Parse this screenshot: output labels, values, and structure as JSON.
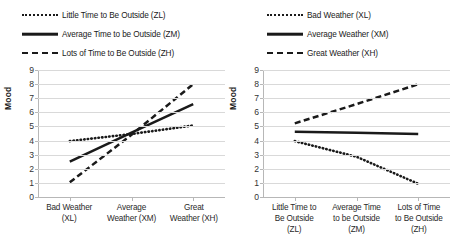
{
  "chart_data": [
    {
      "panel": "left",
      "type": "line",
      "title": "",
      "xlabel": "",
      "ylabel": "Mood",
      "ylim": [
        0,
        9
      ],
      "yticks": [
        0,
        1,
        2,
        3,
        4,
        5,
        6,
        7,
        8,
        9
      ],
      "grid": true,
      "legend_position": "top",
      "categories": [
        "Bad Weather (XL)",
        "Average Weather (XM)",
        "Great Weather (XH)"
      ],
      "category_lines": [
        [
          "Bad Weather",
          "(XL)"
        ],
        [
          "Average",
          "Weather (XM)"
        ],
        [
          "Great",
          "Weather (XH)"
        ]
      ],
      "series": [
        {
          "name": "Little Time to Be Outside (ZL)",
          "style": "dotted",
          "values": [
            4.0,
            4.5,
            5.1
          ]
        },
        {
          "name": "Average Time to be Outside (ZM)",
          "style": "solid",
          "values": [
            2.55,
            4.6,
            6.6
          ]
        },
        {
          "name": "Lots of Time to Be Outside (ZH)",
          "style": "dashed",
          "values": [
            1.1,
            4.45,
            8.0
          ]
        }
      ]
    },
    {
      "panel": "right",
      "type": "line",
      "title": "",
      "xlabel": "",
      "ylabel": "Mood",
      "ylim": [
        0,
        9
      ],
      "yticks": [
        0,
        1,
        2,
        3,
        4,
        5,
        6,
        7,
        8,
        9
      ],
      "grid": true,
      "legend_position": "top",
      "categories": [
        "Little Time to Be Outside (ZL)",
        "Average Time to be Outside (ZM)",
        "Lots of Time to Be Outside (ZH)"
      ],
      "category_lines": [
        [
          "Little Time to",
          "Be Outside",
          "(ZL)"
        ],
        [
          "Average Time",
          "to be Outside",
          "(ZM)"
        ],
        [
          "Lots of Time",
          "to Be Outside",
          "(ZH)"
        ]
      ],
      "series": [
        {
          "name": "Bad Weather (XL)",
          "style": "dotted",
          "values": [
            4.0,
            2.9,
            1.0
          ]
        },
        {
          "name": "Average Weather (XM)",
          "style": "solid",
          "values": [
            4.65,
            4.58,
            4.5
          ]
        },
        {
          "name": "Great Weather (XH)",
          "style": "dashed",
          "values": [
            5.25,
            6.6,
            8.0
          ]
        }
      ]
    }
  ],
  "left_chart": {
    "legend": [
      {
        "label": "Little Time to Be Outside (ZL)",
        "style": "dotted"
      },
      {
        "label": "Average Time to be Outside (ZM)",
        "style": "solid"
      },
      {
        "label": "Lots of Time to Be Outside (ZH)",
        "style": "dashed"
      }
    ],
    "ylabel": "Mood",
    "yticks": [
      "9",
      "8",
      "7",
      "6",
      "5",
      "4",
      "3",
      "2",
      "1",
      "0"
    ],
    "xlabels": [
      [
        "Bad Weather",
        "(XL)"
      ],
      [
        "Average",
        "Weather (XM)"
      ],
      [
        "Great",
        "Weather (XH)"
      ]
    ]
  },
  "right_chart": {
    "legend": [
      {
        "label": "Bad Weather (XL)",
        "style": "dotted"
      },
      {
        "label": "Average Weather (XM)",
        "style": "solid"
      },
      {
        "label": "Great Weather (XH)",
        "style": "dashed"
      }
    ],
    "ylabel": "Mood",
    "yticks": [
      "9",
      "8",
      "7",
      "6",
      "5",
      "4",
      "3",
      "2",
      "1",
      "0"
    ],
    "xlabels": [
      [
        "Little Time to",
        "Be Outside",
        "(ZL)"
      ],
      [
        "Average Time",
        "to be Outside",
        "(ZM)"
      ],
      [
        "Lots of Time",
        "to Be Outside",
        "(ZH)"
      ]
    ]
  },
  "colors": {
    "line": "#1a1a1a",
    "gridline": "#d9d9d9",
    "axis": "#b7b7b7",
    "background": "#ffffff"
  }
}
